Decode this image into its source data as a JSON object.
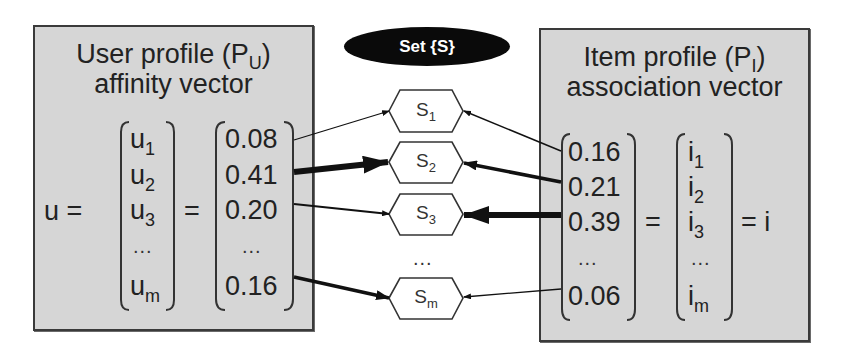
{
  "user_profile": {
    "title_line1": "User profile (P",
    "title_sub": "U",
    "title_close": ")",
    "title_line2": "affinity vector",
    "lhs": "u =",
    "eq": "=",
    "symbols": [
      {
        "base": "u",
        "sub": "1"
      },
      {
        "base": "u",
        "sub": "2"
      },
      {
        "base": "u",
        "sub": "3"
      },
      {
        "base": "...",
        "sub": ""
      },
      {
        "base": "u",
        "sub": "m"
      }
    ],
    "values": [
      "0.08",
      "0.41",
      "0.20",
      "...",
      "0.16"
    ]
  },
  "set": {
    "label": "Set {S}",
    "items": [
      {
        "base": "S",
        "sub": "1"
      },
      {
        "base": "S",
        "sub": "2"
      },
      {
        "base": "S",
        "sub": "3"
      },
      {
        "base": "S",
        "sub": "m"
      }
    ],
    "ellipsis": "..."
  },
  "item_profile": {
    "title_line1": "Item profile (P",
    "title_sub": "I",
    "title_close": ")",
    "title_line2": "association vector",
    "values": [
      "0.16",
      "0.21",
      "0.39",
      "...",
      "0.06"
    ],
    "eq": "=",
    "symbols": [
      {
        "base": "i",
        "sub": "1"
      },
      {
        "base": "i",
        "sub": "2"
      },
      {
        "base": "i",
        "sub": "3"
      },
      {
        "base": "...",
        "sub": ""
      },
      {
        "base": "i",
        "sub": "m"
      }
    ],
    "rhs": "= i"
  },
  "colors": {
    "panel_fill": "#d6d6d6",
    "panel_border": "#3a3a3a",
    "ellipse_fill": "#0a0a0a",
    "arrow": "#111111"
  }
}
